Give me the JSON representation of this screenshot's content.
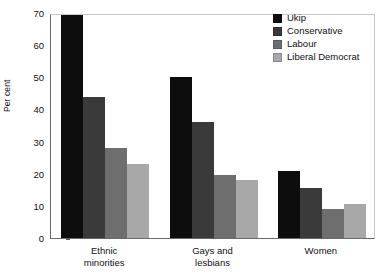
{
  "chart_data": {
    "type": "bar",
    "title": "",
    "xlabel": "",
    "ylabel": "Per cent",
    "ylim": [
      0,
      70
    ],
    "yticks": [
      0,
      10,
      20,
      30,
      40,
      50,
      60,
      70
    ],
    "grid": false,
    "legend_position": "top-right",
    "categories": [
      "Ethnic\nminorities",
      "Gays and\nlesbians",
      "Women"
    ],
    "series": [
      {
        "name": "Ukip",
        "color": "#0d0d0d",
        "values": [
          70,
          50,
          21
        ]
      },
      {
        "name": "Conservative",
        "color": "#3a3a3a",
        "values": [
          44,
          36,
          15.5
        ]
      },
      {
        "name": "Labour",
        "color": "#6e6e6e",
        "values": [
          28,
          19.5,
          9
        ]
      },
      {
        "name": "Liberal Democrat",
        "color": "#a8a8a8",
        "values": [
          23,
          18,
          10.5
        ]
      }
    ]
  }
}
